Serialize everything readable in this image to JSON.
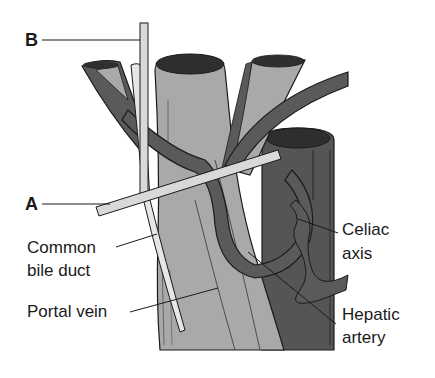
{
  "diagram": {
    "type": "anatomical illustration",
    "letter_labels": {
      "a": "A",
      "b": "B"
    },
    "labels": {
      "common_bile_duct_line1": "Common",
      "common_bile_duct_line2": "bile duct",
      "portal_vein": "Portal vein",
      "celiac_axis_line1": "Celiac",
      "celiac_axis_line2": "axis",
      "hepatic_artery_line1": "Hepatic",
      "hepatic_artery_line2": "artery"
    },
    "colors": {
      "background": "#ffffff",
      "portal_vein": "#a9a9a9",
      "aorta": "#555555",
      "arteries": "#5a5a5a",
      "bile_duct": "#e6e6e6",
      "rods": "#d9d9d9",
      "outline": "#1a1a1a"
    }
  }
}
